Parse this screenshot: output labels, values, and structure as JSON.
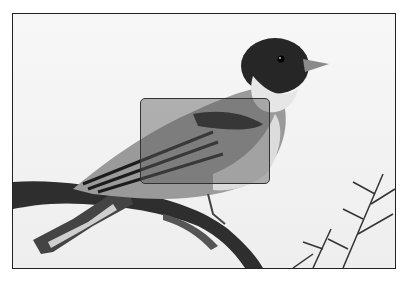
{
  "image": {
    "subject": "bird perched on branch",
    "style": "grayscale photograph",
    "frame_color": "#222222",
    "background_color": "#f4f4f4"
  },
  "highlight": {
    "region": "bird wing",
    "x": 139,
    "y": 97,
    "width": 131,
    "height": 87,
    "fill": "rgba(90,90,90,0.45)",
    "border_color": "#333333"
  }
}
